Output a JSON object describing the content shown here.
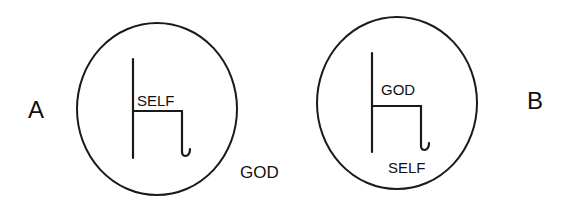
{
  "figure": {
    "panels": [
      {
        "id": "A",
        "panel_label": "A",
        "inner_label": "SELF",
        "outer_label": "GOD",
        "description": "Circle containing chair; SELF seated on chair inside circle, GOD outside circle"
      },
      {
        "id": "B",
        "panel_label": "B",
        "inner_label": "GOD",
        "below_chair_label": "SELF",
        "description": "Circle containing chair; GOD seated on chair, SELF below chair inside circle"
      }
    ],
    "colors": {
      "ink": "#1a1a1a",
      "background": "#ffffff"
    }
  }
}
